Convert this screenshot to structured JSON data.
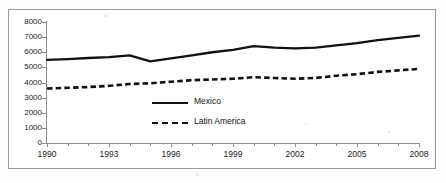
{
  "chart_data": {
    "type": "line",
    "title": "",
    "xlabel": "",
    "ylabel": "",
    "x": [
      1990,
      1991,
      1992,
      1993,
      1994,
      1995,
      1996,
      1997,
      1998,
      1999,
      2000,
      2001,
      2002,
      2003,
      2004,
      2005,
      2006,
      2007,
      2008
    ],
    "xlim": [
      1990,
      2008
    ],
    "ylim": [
      0,
      8000
    ],
    "xticks": [
      "1990",
      "1993",
      "1996",
      "1999",
      "2002",
      "2005",
      "2008"
    ],
    "yticks": [
      "0",
      "1000",
      "2000",
      "3000",
      "4000",
      "5000",
      "6000",
      "7000",
      "8000"
    ],
    "grid": false,
    "legend_position": "inside-center",
    "series": [
      {
        "name": "Mexico",
        "style": "solid",
        "color": "#111111",
        "values": [
          5500,
          5550,
          5620,
          5680,
          5800,
          5400,
          5600,
          5800,
          6000,
          6150,
          6400,
          6300,
          6250,
          6300,
          6450,
          6600,
          6800,
          6950,
          7100
        ]
      },
      {
        "name": "Latin America",
        "style": "dashed",
        "color": "#111111",
        "values": [
          3600,
          3650,
          3700,
          3780,
          3900,
          3950,
          4050,
          4150,
          4200,
          4250,
          4350,
          4300,
          4250,
          4300,
          4450,
          4550,
          4700,
          4800,
          4900
        ]
      }
    ]
  },
  "legend": {
    "items": [
      {
        "label": "Mexico",
        "style": "solid"
      },
      {
        "label": "Latin America",
        "style": "dashed"
      }
    ]
  }
}
